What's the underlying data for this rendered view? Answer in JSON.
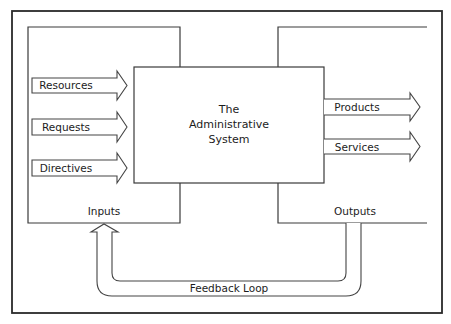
{
  "diagram": {
    "center": {
      "lines": [
        "The",
        "Administrative",
        "System"
      ]
    },
    "inputs": {
      "label": "Inputs",
      "arrows": [
        {
          "label": "Resources"
        },
        {
          "label": "Requests"
        },
        {
          "label": "Directives"
        }
      ]
    },
    "outputs": {
      "label": "Outputs",
      "arrows": [
        {
          "label": "Products"
        },
        {
          "label": "Services"
        }
      ]
    },
    "feedback": {
      "label": "Feedback Loop"
    },
    "colors": {
      "line": "#3a3a3a",
      "background": "#ffffff",
      "text": "#1c1c1c"
    }
  }
}
